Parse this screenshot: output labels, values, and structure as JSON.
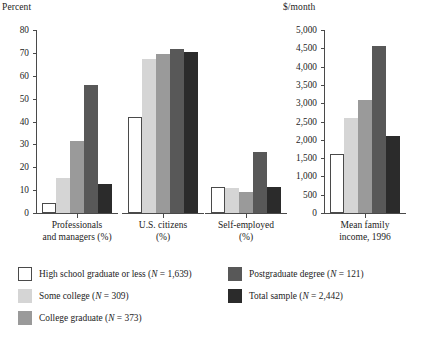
{
  "chart_data": [
    {
      "type": "bar",
      "id": "percent-chart",
      "title": "",
      "ylabel": "Percent",
      "xlabel": "",
      "ylim": [
        0,
        80
      ],
      "ytick_labels": [
        "0",
        "10",
        "20",
        "30",
        "40",
        "50",
        "60",
        "70",
        "80"
      ],
      "ytick_values": [
        0,
        10,
        20,
        30,
        40,
        50,
        60,
        70,
        80
      ],
      "grid": false,
      "legend_position": "below",
      "categories": [
        "Professionals and managers (%)",
        "U.S. citizens (%)",
        "Self-employed (%)"
      ],
      "category_lines": [
        [
          "Professionals",
          "and managers (%)"
        ],
        [
          "U.S. citizens",
          "(%)"
        ],
        [
          "Self-employed",
          "(%)"
        ]
      ],
      "series": [
        {
          "name": "High school graduate or less",
          "color": "#ffffff",
          "values": [
            4.5,
            42.0,
            11.5
          ]
        },
        {
          "name": "Some college",
          "color": "#d5d5d5",
          "values": [
            15.5,
            67.5,
            11.0
          ]
        },
        {
          "name": "College graduate",
          "color": "#9a9a9a",
          "values": [
            31.5,
            69.5,
            9.0
          ]
        },
        {
          "name": "Postgraduate degree",
          "color": "#585858",
          "values": [
            56.0,
            71.5,
            26.5
          ]
        },
        {
          "name": "Total sample",
          "color": "#2b2b2b",
          "values": [
            12.5,
            70.5,
            11.5
          ]
        }
      ]
    },
    {
      "type": "bar",
      "id": "income-chart",
      "title": "",
      "ylabel": "$/month",
      "xlabel": "",
      "ylim": [
        0,
        5000
      ],
      "ytick_labels": [
        "0",
        "500",
        "1,000",
        "1,500",
        "2,000",
        "2,500",
        "3,000",
        "3,500",
        "4,000",
        "4,500",
        "5,000"
      ],
      "ytick_values": [
        0,
        500,
        1000,
        1500,
        2000,
        2500,
        3000,
        3500,
        4000,
        4500,
        5000
      ],
      "grid": false,
      "legend_position": "below",
      "categories": [
        "Mean family income, 1996"
      ],
      "category_lines": [
        [
          "Mean family",
          "income, 1996"
        ]
      ],
      "series": [
        {
          "name": "High school graduate or less",
          "color": "#ffffff",
          "values": [
            1600
          ]
        },
        {
          "name": "Some college",
          "color": "#d5d5d5",
          "values": [
            2600
          ]
        },
        {
          "name": "College graduate",
          "color": "#9a9a9a",
          "values": [
            3100
          ]
        },
        {
          "name": "Postgraduate degree",
          "color": "#585858",
          "values": [
            4550
          ]
        },
        {
          "name": "Total sample",
          "color": "#2b2b2b",
          "values": [
            2100
          ]
        }
      ]
    }
  ],
  "legend": {
    "entries": [
      {
        "label_prefix": "High school graduate or less (",
        "n_italic": "N",
        "n_value": " = 1,639)",
        "color": "#ffffff"
      },
      {
        "label_prefix": "Some college (",
        "n_italic": "N",
        "n_value": " = 309)",
        "color": "#d5d5d5"
      },
      {
        "label_prefix": "College graduate (",
        "n_italic": "N",
        "n_value": " = 373)",
        "color": "#9a9a9a"
      },
      {
        "label_prefix": "Postgraduate degree (",
        "n_italic": "N",
        "n_value": " = 121)",
        "color": "#585858"
      },
      {
        "label_prefix": "Total sample (",
        "n_italic": "N",
        "n_value": " = 2,442)",
        "color": "#2b2b2b"
      }
    ]
  },
  "colors": {
    "axis": "#4a4a4a",
    "text": "#1d1d1d",
    "background": "#ffffff",
    "white_bar": "#ffffff",
    "light_gray_bar": "#d5d5d5",
    "medium_gray_bar": "#9a9a9a",
    "dark_gray_bar": "#585858",
    "black_bar": "#2b2b2b"
  }
}
